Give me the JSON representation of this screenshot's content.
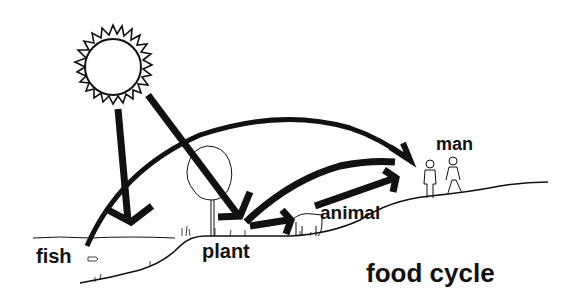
{
  "diagram": {
    "title": "food cycle",
    "labels": {
      "fish": "fish",
      "plant": "plant",
      "animal": "animal",
      "man": "man"
    },
    "elements": {
      "sun": "sun-icon",
      "tree": "tree-icon",
      "grazing_animal": "cow-icon",
      "people": [
        "standing-man-icon",
        "walking-man-icon"
      ],
      "fish": "fish-icon"
    },
    "arrows": [
      {
        "from": "sun",
        "to": "water"
      },
      {
        "from": "sun",
        "to": "plant"
      },
      {
        "from": "fish",
        "to": "man"
      },
      {
        "from": "plant",
        "to": "man"
      },
      {
        "from": "plant",
        "to": "animal"
      },
      {
        "from": "animal",
        "to": "man"
      }
    ],
    "colors": {
      "ink": "#111111",
      "background": "#ffffff"
    }
  }
}
